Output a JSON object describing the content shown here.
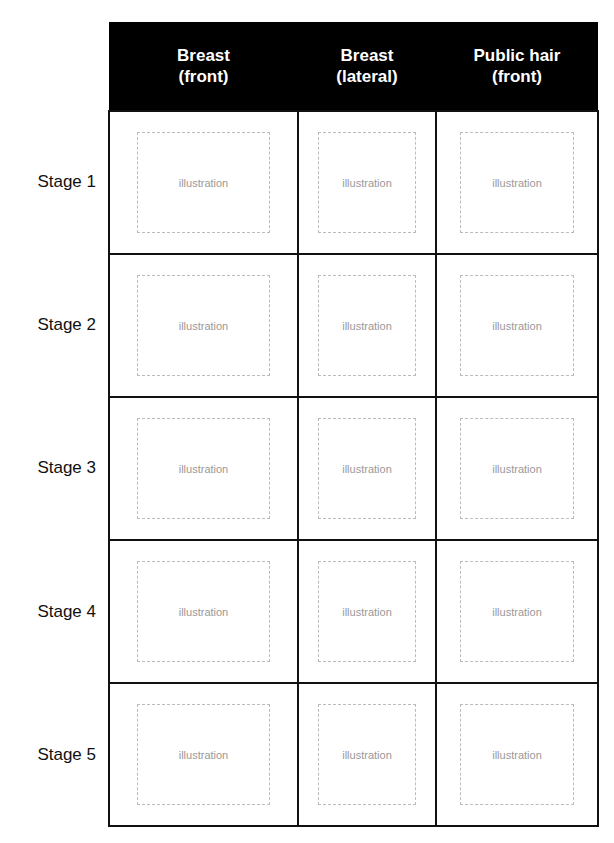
{
  "headers": [
    "Breast\n(front)",
    "Breast\n(lateral)",
    "Public hair\n(front)"
  ],
  "header_lines": [
    [
      "Breast",
      "(front)"
    ],
    [
      "Breast",
      "(lateral)"
    ],
    [
      "Public hair",
      "(front)"
    ]
  ],
  "stages": [
    "Stage 1",
    "Stage 2",
    "Stage 3",
    "Stage 4",
    "Stage 5"
  ],
  "placeholder": "illustration",
  "colors": {
    "header_bg": "#000000",
    "header_text": "#ffffff",
    "grid": "#111111"
  }
}
